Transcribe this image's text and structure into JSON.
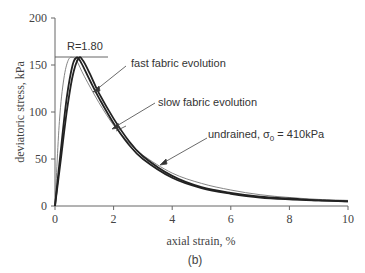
{
  "chart_data": {
    "type": "line",
    "title": "",
    "caption": "(b)",
    "xlabel": "axial strain, %",
    "ylabel": "deviatoric stress, kPa",
    "xlim": [
      0,
      10
    ],
    "ylim": [
      0,
      200
    ],
    "xticks": [
      0,
      2,
      4,
      6,
      8,
      10
    ],
    "yticks": [
      0,
      50,
      100,
      150,
      200
    ],
    "grid": false,
    "annotations": [
      {
        "text": "R=1.80",
        "x": 0.7,
        "y": 163
      },
      {
        "text": "fast fabric evolution",
        "target_x": 1.35,
        "target_y": 122
      },
      {
        "text": "slow fabric evolution",
        "target_x": 2.0,
        "target_y": 82
      },
      {
        "text": "undrained, σ0 = 410kPa",
        "target_x": 3.3,
        "target_y": 46
      }
    ],
    "reference_line": {
      "y": 158,
      "x_range": [
        0,
        1.8
      ],
      "label": "R=1.80"
    },
    "series": [
      {
        "name": "undrained, σ0 = 410kPa",
        "style": "thin",
        "x": [
          0,
          0.15,
          0.3,
          0.45,
          0.6,
          0.75,
          1.0,
          1.5,
          2.0,
          2.5,
          3.0,
          4.0,
          5.0,
          6.0,
          7.0,
          8.0,
          9.0,
          10.0
        ],
        "y": [
          0,
          90,
          135,
          155,
          158,
          154,
          138,
          110,
          86,
          68,
          54,
          35,
          24,
          17,
          12,
          9,
          7,
          6
        ]
      },
      {
        "name": "fast fabric evolution",
        "style": "thick",
        "x": [
          0,
          0.2,
          0.4,
          0.6,
          0.75,
          0.9,
          1.2,
          1.5,
          2.0,
          2.5,
          3.0,
          4.0,
          5.0,
          6.0,
          7.0,
          8.0,
          9.0,
          10.0
        ],
        "y": [
          0,
          60,
          115,
          150,
          158,
          152,
          133,
          115,
          88,
          66,
          50,
          30,
          19,
          13,
          9,
          7,
          6,
          5
        ]
      },
      {
        "name": "slow fabric evolution",
        "style": "thick",
        "x": [
          0,
          0.2,
          0.4,
          0.6,
          0.8,
          0.95,
          1.2,
          1.5,
          2.0,
          2.5,
          3.0,
          4.0,
          5.0,
          6.0,
          7.0,
          8.0,
          9.0,
          10.0
        ],
        "y": [
          0,
          50,
          100,
          138,
          157,
          155,
          140,
          120,
          93,
          70,
          53,
          32,
          20,
          14,
          10,
          8,
          6,
          5
        ]
      }
    ]
  },
  "labels": {
    "ylabel": "deviatoric stress, kPa",
    "xlabel": "axial strain, %",
    "caption": "(b)",
    "r_label": "R=1.80",
    "fast": "fast fabric evolution",
    "slow": "slow fabric evolution",
    "undrained_prefix": "undrained, σ",
    "undrained_sub": "0",
    "undrained_suffix": " = 410kPa",
    "xt0": "0",
    "xt2": "2",
    "xt4": "4",
    "xt6": "6",
    "xt8": "8",
    "xt10": "10",
    "yt0": "0",
    "yt50": "50",
    "yt100": "100",
    "yt150": "150",
    "yt200": "200"
  }
}
